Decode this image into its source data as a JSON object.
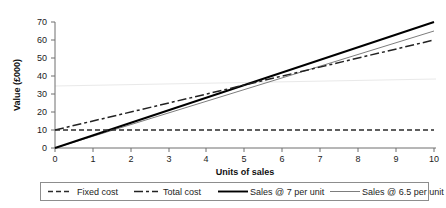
{
  "chart_data": {
    "type": "line",
    "title": "",
    "xlabel": "Units of sales",
    "ylabel": "Value (£000)",
    "xlim": [
      0,
      10
    ],
    "ylim": [
      0,
      70
    ],
    "grid": false,
    "legend_position": "bottom",
    "x_ticks": [
      "0",
      "1",
      "2",
      "3",
      "4",
      "5",
      "6",
      "7",
      "8",
      "9",
      "10"
    ],
    "y_ticks": [
      "0",
      "10",
      "20",
      "30",
      "40",
      "50",
      "60",
      "70"
    ],
    "x": [
      0,
      10
    ],
    "series": [
      {
        "name": "Fixed cost",
        "style": "dashed",
        "color": "#2b2b2b",
        "values": [
          10,
          10
        ]
      },
      {
        "name": "Total cost",
        "style": "dash-dot",
        "color": "#222222",
        "values": [
          10,
          60
        ]
      },
      {
        "name": "Sales @ 7 per unit",
        "style": "solid-thick",
        "color": "#000000",
        "values": [
          0,
          70
        ]
      },
      {
        "name": "Sales @ 6.5 per unit",
        "style": "solid-thin",
        "color": "#7d7d7d",
        "values": [
          0,
          65
        ]
      }
    ]
  },
  "axes": {
    "y_title": "Value (£000)",
    "x_title": "Units of sales",
    "y_tick_labels": [
      "70",
      "60",
      "50",
      "40",
      "30",
      "20",
      "10",
      "0"
    ],
    "x_tick_labels": [
      "0",
      "1",
      "2",
      "3",
      "4",
      "5",
      "6",
      "7",
      "8",
      "9",
      "10"
    ]
  },
  "legend": {
    "items": [
      {
        "label": "Fixed cost",
        "swatch": "dashed-line-swatch"
      },
      {
        "label": "Total cost",
        "swatch": "dash-dot-line-swatch"
      },
      {
        "label": "Sales @ 7 per unit",
        "swatch": "solid-thick-line-swatch"
      },
      {
        "label": "Sales @ 6.5 per unit",
        "swatch": "solid-thin-line-swatch"
      }
    ]
  }
}
